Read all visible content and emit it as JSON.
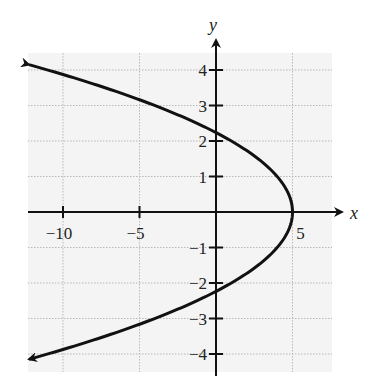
{
  "chart_data": {
    "type": "line",
    "title": "",
    "xlabel": "x",
    "ylabel": "y",
    "equation": "x = 5 - y^2",
    "xlim": [
      -12.5,
      7.5
    ],
    "ylim": [
      -4.5,
      4.5
    ],
    "x_ticks": [
      -10,
      -5,
      5
    ],
    "x_tick_labels": [
      "−10",
      "−5",
      "5"
    ],
    "y_ticks": [
      -4,
      -3,
      -2,
      -1,
      1,
      2,
      3,
      4
    ],
    "y_tick_labels": [
      "−4",
      "−3",
      "−2",
      "−1",
      "1",
      "2",
      "3",
      "4"
    ],
    "grid": true,
    "grid_vertical_at": [
      -10,
      -5,
      0,
      5
    ],
    "grid_horizontal_at": [
      -4,
      -3,
      -2,
      -1,
      0,
      1,
      2,
      3,
      4
    ],
    "series": [
      {
        "name": "parabola",
        "points": [
          {
            "x": -12.2,
            "y": 4.15
          },
          {
            "x": -11,
            "y": 4
          },
          {
            "x": -4,
            "y": 3
          },
          {
            "x": 1,
            "y": 2
          },
          {
            "x": 4,
            "y": 1
          },
          {
            "x": 5,
            "y": 0
          },
          {
            "x": 4,
            "y": -1
          },
          {
            "x": 1,
            "y": -2
          },
          {
            "x": -4,
            "y": -3
          },
          {
            "x": -11,
            "y": -4
          },
          {
            "x": -12.2,
            "y": -4.15
          }
        ],
        "vertex": {
          "x": 5,
          "y": 0
        },
        "y_intercepts": [
          2.24,
          -2.24
        ],
        "arrows": "both ends"
      }
    ]
  },
  "labels": {
    "x_axis": "x",
    "y_axis": "y",
    "x_ticks": [
      "−10",
      "−5",
      "5"
    ],
    "y_ticks_pos": [
      "4",
      "3",
      "2",
      "1"
    ],
    "y_ticks_neg": [
      "−1",
      "−2",
      "−3",
      "−4"
    ]
  }
}
